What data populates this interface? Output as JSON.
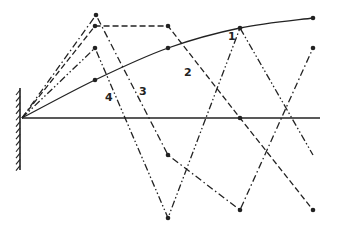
{
  "diagram": {
    "type": "mode-shapes",
    "ink_color": "#222222",
    "background": "#ffffff",
    "origin": [
      22,
      118
    ],
    "baseline": {
      "x1": 22,
      "y1": 118,
      "x2": 320,
      "y2": 118
    },
    "wall": {
      "x": 20,
      "y1": 88,
      "y2": 170,
      "hatch_count": 13
    },
    "curves": [
      {
        "id": "1",
        "label": "1",
        "style": "solid",
        "points": [
          [
            22,
            118
          ],
          [
            95,
            80
          ],
          [
            168,
            48
          ],
          [
            240,
            28
          ],
          [
            313,
            18
          ]
        ],
        "dots": [
          [
            95,
            80
          ],
          [
            168,
            48
          ],
          [
            240,
            28
          ],
          [
            313,
            18
          ]
        ],
        "label_pos": [
          228,
          40
        ]
      },
      {
        "id": "2",
        "label": "2",
        "style": "dashed",
        "points": [
          [
            22,
            118
          ],
          [
            95,
            26
          ],
          [
            168,
            26
          ],
          [
            240,
            118
          ],
          [
            313,
            210
          ]
        ],
        "dots": [
          [
            95,
            26
          ],
          [
            168,
            26
          ],
          [
            240,
            118
          ],
          [
            313,
            210
          ]
        ],
        "label_pos": [
          184,
          76
        ]
      },
      {
        "id": "3",
        "label": "3",
        "style": "dash-dot",
        "points": [
          [
            22,
            118
          ],
          [
            96,
            15
          ],
          [
            168,
            155
          ],
          [
            240,
            210
          ],
          [
            313,
            48
          ]
        ],
        "dots": [
          [
            96,
            15
          ],
          [
            168,
            155
          ],
          [
            240,
            210
          ],
          [
            313,
            48
          ]
        ],
        "label_pos": [
          139,
          95
        ]
      },
      {
        "id": "4",
        "label": "4",
        "style": "dash-dot-dot",
        "points": [
          [
            22,
            118
          ],
          [
            95,
            48
          ],
          [
            168,
            218
          ],
          [
            240,
            28
          ],
          [
            313,
            155
          ]
        ],
        "dots": [
          [
            95,
            48
          ],
          [
            168,
            218
          ]
        ],
        "label_pos": [
          105,
          101
        ]
      }
    ],
    "labels": [
      "1",
      "2",
      "3",
      "4"
    ]
  }
}
